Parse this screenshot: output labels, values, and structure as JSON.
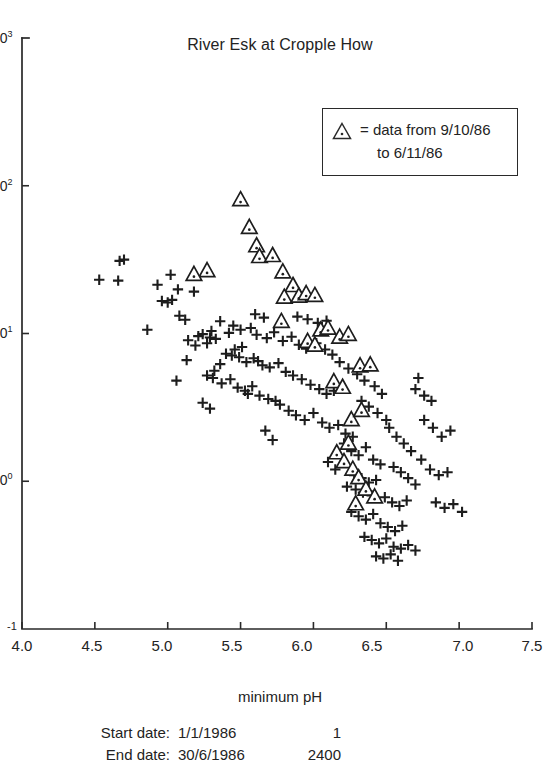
{
  "chart_data": {
    "type": "scatter",
    "title": "River Esk at Cropple How",
    "xlabel": "minimum pH",
    "ylabel": "",
    "xlim": [
      4.0,
      7.5
    ],
    "ylim_log10": [
      -1,
      3
    ],
    "yscale": "log",
    "xticks": [
      "4.0",
      "4.5",
      "5.0",
      "5.5",
      "6.0",
      "6.5",
      "7.0",
      "7.5"
    ],
    "xtick_values": [
      4.0,
      4.5,
      5.0,
      5.5,
      6.0,
      6.5,
      7.0,
      7.5
    ],
    "yticks": [
      "10",
      "10",
      "10",
      "10",
      "10"
    ],
    "ytick_exponents": [
      "3",
      "2",
      "1",
      "0",
      "-1"
    ],
    "ytick_values": [
      1000,
      100,
      10,
      1,
      0.1
    ],
    "grid": false,
    "legend_position": "top-right",
    "series": [
      {
        "name": "plus-series",
        "marker": "plus",
        "points": [
          [
            4.53,
            23.1
          ],
          [
            4.67,
            31.0
          ],
          [
            4.7,
            31.6
          ],
          [
            4.66,
            22.8
          ],
          [
            4.93,
            21.4
          ],
          [
            5.02,
            25.0
          ],
          [
            5.07,
            19.9
          ],
          [
            4.96,
            16.6
          ],
          [
            5.0,
            16.2
          ],
          [
            5.03,
            16.9
          ],
          [
            4.86,
            10.6
          ],
          [
            5.18,
            19.2
          ],
          [
            5.29,
            9.4
          ],
          [
            5.4,
            7.3
          ],
          [
            5.46,
            7.8
          ],
          [
            5.51,
            8.1
          ],
          [
            5.36,
            6.2
          ],
          [
            5.32,
            5.6
          ],
          [
            5.27,
            5.2
          ],
          [
            5.13,
            6.6
          ],
          [
            5.62,
            6.5
          ],
          [
            5.06,
            4.8
          ],
          [
            5.55,
            3.9
          ],
          [
            5.74,
            3.5
          ],
          [
            5.36,
            12.1
          ],
          [
            5.45,
            11.3
          ],
          [
            5.42,
            10.1
          ],
          [
            5.5,
            10.6
          ],
          [
            5.57,
            10.9
          ],
          [
            5.3,
            10.4
          ],
          [
            5.24,
            9.9
          ],
          [
            5.33,
            9.2
          ],
          [
            5.21,
            9.6
          ],
          [
            5.27,
            8.6
          ],
          [
            5.14,
            9.0
          ],
          [
            5.19,
            8.3
          ],
          [
            5.61,
            9.8
          ],
          [
            5.68,
            9.3
          ],
          [
            5.73,
            10.2
          ],
          [
            5.79,
            8.9
          ],
          [
            5.85,
            9.5
          ],
          [
            5.9,
            8.4
          ],
          [
            5.95,
            7.9
          ],
          [
            6.02,
            8.6
          ],
          [
            5.44,
            7.1
          ],
          [
            5.49,
            6.9
          ],
          [
            5.54,
            6.4
          ],
          [
            5.59,
            6.8
          ],
          [
            5.65,
            6.1
          ],
          [
            5.7,
            5.9
          ],
          [
            5.76,
            6.3
          ],
          [
            5.81,
            5.5
          ],
          [
            5.31,
            5.0
          ],
          [
            5.37,
            4.6
          ],
          [
            5.43,
            4.9
          ],
          [
            5.48,
            4.3
          ],
          [
            5.53,
            4.1
          ],
          [
            5.58,
            4.4
          ],
          [
            5.63,
            3.8
          ],
          [
            5.69,
            3.6
          ],
          [
            5.24,
            3.4
          ],
          [
            5.29,
            3.1
          ],
          [
            5.86,
            5.2
          ],
          [
            5.92,
            4.9
          ],
          [
            5.98,
            4.5
          ],
          [
            6.04,
            4.2
          ],
          [
            6.09,
            3.9
          ],
          [
            6.14,
            4.1
          ],
          [
            5.77,
            3.3
          ],
          [
            5.83,
            3.0
          ],
          [
            5.88,
            2.8
          ],
          [
            5.94,
            2.6
          ],
          [
            6.0,
            2.9
          ],
          [
            6.06,
            2.5
          ],
          [
            6.11,
            2.3
          ],
          [
            6.17,
            2.4
          ],
          [
            6.22,
            2.1
          ],
          [
            6.27,
            2.0
          ],
          [
            5.67,
            2.2
          ],
          [
            5.72,
            1.9
          ],
          [
            6.18,
            6.4
          ],
          [
            6.24,
            5.8
          ],
          [
            6.3,
            5.3
          ],
          [
            6.35,
            4.8
          ],
          [
            6.13,
            7.2
          ],
          [
            6.08,
            7.8
          ],
          [
            6.42,
            4.4
          ],
          [
            6.47,
            3.9
          ],
          [
            6.33,
            3.5
          ],
          [
            6.38,
            3.2
          ],
          [
            6.44,
            2.9
          ],
          [
            6.5,
            2.6
          ],
          [
            6.21,
            1.8
          ],
          [
            6.26,
            1.6
          ],
          [
            6.31,
            1.5
          ],
          [
            6.36,
            1.7
          ],
          [
            6.41,
            1.4
          ],
          [
            6.46,
            1.3
          ],
          [
            6.15,
            1.2
          ],
          [
            6.1,
            1.35
          ],
          [
            6.28,
            1.1
          ],
          [
            6.33,
            1.05
          ],
          [
            6.38,
            0.98
          ],
          [
            6.43,
            1.02
          ],
          [
            6.23,
            0.92
          ],
          [
            6.29,
            0.88
          ],
          [
            6.34,
            0.84
          ],
          [
            6.4,
            0.8
          ],
          [
            6.52,
            2.3
          ],
          [
            6.57,
            2.0
          ],
          [
            6.62,
            1.8
          ],
          [
            6.67,
            1.6
          ],
          [
            6.55,
            1.25
          ],
          [
            6.6,
            1.15
          ],
          [
            6.65,
            1.05
          ],
          [
            6.7,
            0.95
          ],
          [
            6.49,
            0.78
          ],
          [
            6.54,
            0.72
          ],
          [
            6.59,
            0.68
          ],
          [
            6.64,
            0.74
          ],
          [
            6.26,
            0.62
          ],
          [
            6.31,
            0.58
          ],
          [
            6.36,
            0.55
          ],
          [
            6.41,
            0.6
          ],
          [
            6.46,
            0.52
          ],
          [
            6.51,
            0.49
          ],
          [
            6.56,
            0.46
          ],
          [
            6.61,
            0.5
          ],
          [
            6.35,
            0.42
          ],
          [
            6.4,
            0.4
          ],
          [
            6.45,
            0.38
          ],
          [
            6.5,
            0.41
          ],
          [
            6.55,
            0.36
          ],
          [
            6.6,
            0.35
          ],
          [
            6.65,
            0.37
          ],
          [
            6.7,
            0.34
          ],
          [
            6.43,
            0.31
          ],
          [
            6.48,
            0.3
          ],
          [
            6.53,
            0.32
          ],
          [
            6.58,
            0.29
          ],
          [
            6.76,
            2.6
          ],
          [
            6.82,
            2.3
          ],
          [
            6.88,
            2.0
          ],
          [
            6.94,
            2.2
          ],
          [
            6.74,
            1.4
          ],
          [
            6.8,
            1.2
          ],
          [
            6.86,
            1.1
          ],
          [
            6.92,
            1.15
          ],
          [
            5.96,
            12.5
          ],
          [
            6.03,
            11.8
          ],
          [
            6.09,
            12.2
          ],
          [
            5.89,
            13.0
          ],
          [
            6.7,
            4.2
          ],
          [
            6.76,
            3.8
          ],
          [
            6.81,
            3.5
          ],
          [
            6.72,
            5.0
          ],
          [
            5.08,
            13.2
          ],
          [
            5.12,
            12.4
          ],
          [
            5.6,
            13.5
          ],
          [
            5.66,
            12.8
          ],
          [
            6.84,
            0.72
          ],
          [
            6.9,
            0.66
          ],
          [
            6.96,
            0.7
          ],
          [
            7.02,
            0.62
          ]
        ]
      },
      {
        "name": "triangle-series",
        "marker": "triangle-dot",
        "label": "data from 9/10/86 to 6/11/86",
        "points": [
          [
            5.5,
            80.0
          ],
          [
            5.56,
            52.0
          ],
          [
            5.61,
            39.0
          ],
          [
            5.63,
            33.0
          ],
          [
            5.72,
            33.5
          ],
          [
            5.79,
            26.0
          ],
          [
            5.86,
            21.0
          ],
          [
            5.8,
            17.5
          ],
          [
            5.9,
            17.8
          ],
          [
            5.95,
            18.5
          ],
          [
            6.01,
            18.0
          ],
          [
            5.78,
            12.0
          ],
          [
            5.27,
            26.5
          ],
          [
            5.18,
            25.0
          ],
          [
            6.05,
            10.5
          ],
          [
            6.1,
            10.8
          ],
          [
            6.18,
            9.4
          ],
          [
            6.24,
            9.8
          ],
          [
            5.96,
            8.8
          ],
          [
            6.01,
            8.3
          ],
          [
            6.32,
            6.0
          ],
          [
            6.39,
            6.1
          ],
          [
            6.14,
            4.7
          ],
          [
            6.2,
            4.3
          ],
          [
            6.26,
            2.6
          ],
          [
            6.16,
            1.55
          ],
          [
            6.21,
            1.35
          ],
          [
            6.27,
            1.2
          ],
          [
            6.31,
            1.05
          ],
          [
            6.36,
            0.88
          ],
          [
            6.42,
            0.78
          ],
          [
            6.29,
            0.7
          ],
          [
            6.24,
            1.8
          ],
          [
            6.33,
            3.0
          ]
        ]
      }
    ]
  },
  "legend": {
    "equals_text": "= data from 9/10/86",
    "second_line": "to 6/11/86",
    "marker_name": "triangle-dot-marker"
  },
  "footer": {
    "start_label": "Start date:",
    "start_date": "1/1/1986",
    "start_num": "1",
    "end_label": "End date:",
    "end_date": "30/6/1986",
    "end_num": "2400"
  },
  "axis": {
    "x_label": "minimum pH"
  },
  "colors": {
    "ink": "#232323",
    "axis": "#2a2a2a",
    "background": "#ffffff"
  }
}
